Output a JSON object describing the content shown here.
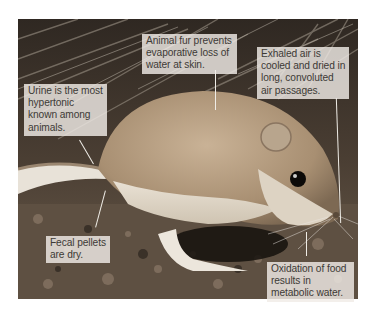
{
  "figure": {
    "colors": {
      "background": "#ffffff",
      "callout_box": "#f0ece6",
      "callout_text": "#3d3a36",
      "leader_line": "#efece6",
      "fur": "#b39a7c",
      "ground": "#5a4c3e"
    },
    "callouts": [
      {
        "id": "fur",
        "text": "Animal fur prevents evaporative loss of water at skin."
      },
      {
        "id": "exhaled-air",
        "text": "Exhaled air is cooled and dried in long, convoluted air passages."
      },
      {
        "id": "urine",
        "text": "Urine is the most hypertonic known among animals."
      },
      {
        "id": "fecal",
        "text": "Fecal pellets are dry."
      },
      {
        "id": "oxidation",
        "text": "Oxidation of food results in metabolic water."
      }
    ]
  }
}
